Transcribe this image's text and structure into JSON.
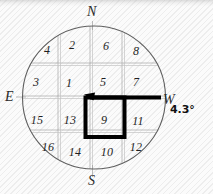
{
  "figure": {
    "type": "compass-grid-diagram",
    "background": "#fbfbfb",
    "ink_color": "#1f1f1f",
    "grid_color": "#9a9a9a",
    "highlight_color": "#000000"
  },
  "compass": {
    "north_label": "N",
    "south_label": "S",
    "east_label": "E",
    "west_label": "W"
  },
  "annotation": {
    "bearing_label": "4.3°"
  },
  "grid": {
    "rows": 4,
    "cols": 4,
    "cells": [
      {
        "label": "4",
        "cx": 47,
        "cy": 50
      },
      {
        "label": "2",
        "cx": 72,
        "cy": 45
      },
      {
        "label": "6",
        "cx": 106,
        "cy": 46
      },
      {
        "label": "8",
        "cx": 136,
        "cy": 51
      },
      {
        "label": "3",
        "cx": 36,
        "cy": 82
      },
      {
        "label": "1",
        "cx": 69,
        "cy": 83
      },
      {
        "label": "5",
        "cx": 103,
        "cy": 82
      },
      {
        "label": "7",
        "cx": 136,
        "cy": 82
      },
      {
        "label": "15",
        "cx": 37,
        "cy": 120
      },
      {
        "label": "13",
        "cx": 70,
        "cy": 120
      },
      {
        "label": "9",
        "cx": 104,
        "cy": 120
      },
      {
        "label": "11",
        "cx": 138,
        "cy": 121
      },
      {
        "label": "16",
        "cx": 48,
        "cy": 147
      },
      {
        "label": "14",
        "cx": 75,
        "cy": 152
      },
      {
        "label": "10",
        "cx": 107,
        "cy": 152
      },
      {
        "label": "12",
        "cx": 136,
        "cy": 147
      }
    ],
    "highlighted_cell": "9"
  },
  "chart_data": {
    "type": "diagram",
    "title": "",
    "circle": {
      "cx": 94,
      "cy": 97.5,
      "r": 72
    },
    "axes": {
      "horizontal": "E-W",
      "vertical": "N-S"
    },
    "grid_lines_x": [
      58,
      90,
      122
    ],
    "grid_lines_y": [
      63,
      96,
      130
    ],
    "offset_grid_lines_x": [
      60,
      92,
      124
    ],
    "offset_grid_lines_y": [
      65,
      98,
      132
    ],
    "highlight_box": {
      "x": 85,
      "y": 97,
      "w": 39,
      "h": 40
    },
    "pointer_line": {
      "x1": 88,
      "y1": 97,
      "x2": 161,
      "y2": 97
    },
    "pointer_arrow_at": "left",
    "bearing_degrees": 4.3
  }
}
